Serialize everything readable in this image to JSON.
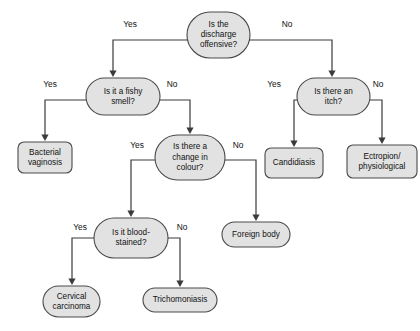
{
  "chart_data": {
    "type": "diagram",
    "diagram_kind": "flowchart",
    "orientation": "top-down",
    "colors": {
      "node_fill": "#e2e2e2",
      "node_stroke": "#4a4a4a",
      "line": "#3a3a3a",
      "text": "#111111",
      "background": "#ffffff"
    },
    "nodes": [
      {
        "id": "q_offensive",
        "kind": "decision",
        "shape": "rounded-stadium",
        "lines": [
          "Is the",
          "discharge",
          "offensive?"
        ],
        "x": 187,
        "y": 12,
        "w": 63,
        "h": 46
      },
      {
        "id": "q_fishy",
        "kind": "decision",
        "shape": "rounded-stadium",
        "lines": [
          "Is it a fishy",
          "smell?"
        ],
        "x": 86,
        "y": 78,
        "w": 74,
        "h": 37
      },
      {
        "id": "q_itch",
        "kind": "decision",
        "shape": "rounded-stadium",
        "lines": [
          "Is there an",
          "itch?"
        ],
        "x": 297,
        "y": 78,
        "w": 73,
        "h": 37
      },
      {
        "id": "t_bacterial",
        "kind": "outcome",
        "shape": "rounded-rect",
        "lines": [
          "Bacterial",
          "vaginosis"
        ],
        "x": 18,
        "y": 142,
        "w": 54,
        "h": 31
      },
      {
        "id": "q_colour",
        "kind": "decision",
        "shape": "rounded-stadium",
        "lines": [
          "Is there a",
          "change in",
          "colour?"
        ],
        "x": 155,
        "y": 135,
        "w": 70,
        "h": 45
      },
      {
        "id": "t_candidiasis",
        "kind": "outcome",
        "shape": "rounded-rect",
        "lines": [
          "Candidiasis"
        ],
        "x": 265,
        "y": 148,
        "w": 58,
        "h": 30
      },
      {
        "id": "t_ectropion",
        "kind": "outcome",
        "shape": "rounded-rect",
        "lines": [
          "Ectropion/",
          "physiological"
        ],
        "x": 347,
        "y": 145,
        "w": 70,
        "h": 33
      },
      {
        "id": "q_blood",
        "kind": "decision",
        "shape": "rounded-stadium",
        "lines": [
          "Is it blood-",
          "stained?"
        ],
        "x": 94,
        "y": 218,
        "w": 74,
        "h": 40
      },
      {
        "id": "t_foreign",
        "kind": "outcome",
        "shape": "rounded-stadium",
        "lines": [
          "Foreign body"
        ],
        "x": 222,
        "y": 222,
        "w": 68,
        "h": 25
      },
      {
        "id": "t_cervical",
        "kind": "outcome",
        "shape": "rounded-stadium",
        "lines": [
          "Cervical",
          "carcinoma"
        ],
        "x": 43,
        "y": 286,
        "w": 57,
        "h": 31
      },
      {
        "id": "t_trichomoniasis",
        "kind": "outcome",
        "shape": "rounded-stadium",
        "lines": [
          "Trichomoniasis"
        ],
        "x": 143,
        "y": 288,
        "w": 74,
        "h": 24
      }
    ],
    "edges": [
      {
        "id": "e_offensive_yes",
        "from": "q_offensive",
        "to": "q_fishy",
        "label": "Yes",
        "label_x": 130,
        "label_y": 25,
        "path": "M 187 40 L 113 40 L 113 72",
        "arrow_x": 113,
        "arrow_y": 77
      },
      {
        "id": "e_offensive_no",
        "from": "q_offensive",
        "to": "q_itch",
        "label": "No",
        "label_x": 287,
        "label_y": 25,
        "path": "M 250 40 L 332 40 L 332 72",
        "arrow_x": 332,
        "arrow_y": 77
      },
      {
        "id": "e_fishy_yes",
        "from": "q_fishy",
        "to": "t_bacterial",
        "label": "Yes",
        "label_x": 50,
        "label_y": 85,
        "path": "M 86 100 L 45 100 L 45 136",
        "arrow_x": 45,
        "arrow_y": 141
      },
      {
        "id": "e_fishy_no",
        "from": "q_fishy",
        "to": "q_colour",
        "label": "No",
        "label_x": 172,
        "label_y": 85,
        "path": "M 160 100 L 190 100 L 190 129",
        "arrow_x": 190,
        "arrow_y": 134
      },
      {
        "id": "e_itch_yes",
        "from": "q_itch",
        "to": "t_candidiasis",
        "label": "Yes",
        "label_x": 274,
        "label_y": 85,
        "path": "M 297 100 L 294 100 L 294 142",
        "arrow_x": 294,
        "arrow_y": 147
      },
      {
        "id": "e_itch_no",
        "from": "q_itch",
        "to": "t_ectropion",
        "label": "No",
        "label_x": 378,
        "label_y": 85,
        "path": "M 370 100 L 382 100 L 382 139",
        "arrow_x": 382,
        "arrow_y": 144
      },
      {
        "id": "e_colour_yes",
        "from": "q_colour",
        "to": "q_blood",
        "label": "Yes",
        "label_x": 137,
        "label_y": 146,
        "path": "M 155 160 L 131 160 L 131 212",
        "arrow_x": 131,
        "arrow_y": 217
      },
      {
        "id": "e_colour_no",
        "from": "q_colour",
        "to": "t_foreign",
        "label": "No",
        "label_x": 238,
        "label_y": 146,
        "path": "M 225 160 L 256 160 L 256 216",
        "arrow_x": 256,
        "arrow_y": 221
      },
      {
        "id": "e_blood_yes",
        "from": "q_blood",
        "to": "t_cervical",
        "label": "Yes",
        "label_x": 80,
        "label_y": 228,
        "path": "M 94 238 L 72 238 L 72 280",
        "arrow_x": 72,
        "arrow_y": 285
      },
      {
        "id": "e_blood_no",
        "from": "q_blood",
        "to": "t_trichomoniasis",
        "label": "No",
        "label_x": 182,
        "label_y": 228,
        "path": "M 168 238 L 180 238 L 180 282",
        "arrow_x": 180,
        "arrow_y": 287
      }
    ]
  }
}
